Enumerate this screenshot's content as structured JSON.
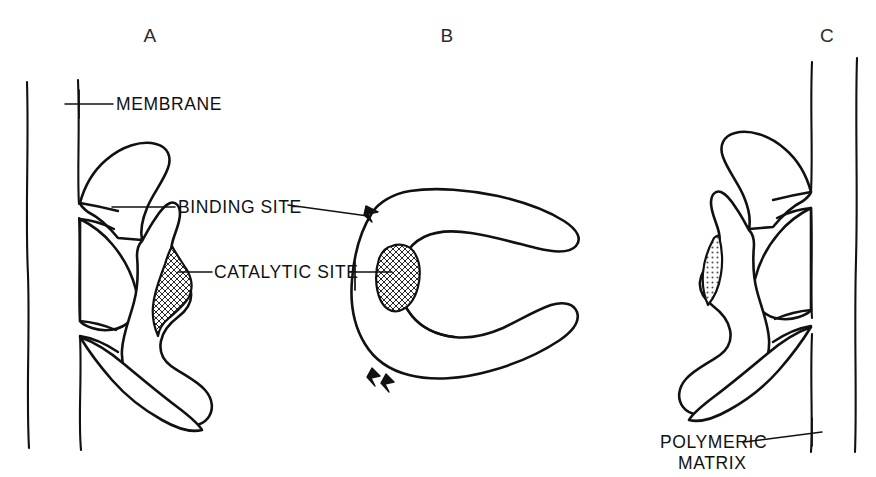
{
  "figure": {
    "background_color": "#ffffff",
    "ink_color": "#111111",
    "width": 876,
    "height": 477
  },
  "panels": [
    {
      "id": "A",
      "letter": "A",
      "description": "Enzyme embedded in membrane, binding site at upper membrane contact, catalytic site facing outward",
      "has_membrane": true,
      "membrane_lines": 2,
      "has_catalytic_site": true,
      "has_binding_site": true
    },
    {
      "id": "B",
      "letter": "B",
      "description": "Free C-shaped enzyme in solution with exposed binding site barbs and catalytic site",
      "has_membrane": false,
      "membrane_lines": 0,
      "has_catalytic_site": true,
      "has_binding_site": true
    },
    {
      "id": "C",
      "letter": "C",
      "description": "Enzyme bound to polymeric matrix, mirrored orientation of panel A",
      "has_membrane": true,
      "membrane_lines": 2,
      "has_catalytic_site": true,
      "has_binding_site": true
    }
  ],
  "callouts": [
    {
      "id": "membrane",
      "label": "MEMBRANE",
      "lines": [
        "MEMBRANE"
      ],
      "anchor_panel": "A"
    },
    {
      "id": "binding-site",
      "label": "BINDING SITE",
      "lines": [
        "BINDING  SITE"
      ],
      "anchor_panel": "A and B"
    },
    {
      "id": "catalytic-site",
      "label": "CATALYTIC SITE",
      "lines": [
        "CATALYTIC  SITE"
      ],
      "anchor_panel": "A and B"
    },
    {
      "id": "polymeric-matrix",
      "label": "POLYMERIC MATRIX",
      "lines": [
        "POLYMERIC",
        "MATRIX"
      ],
      "anchor_panel": "C"
    }
  ]
}
